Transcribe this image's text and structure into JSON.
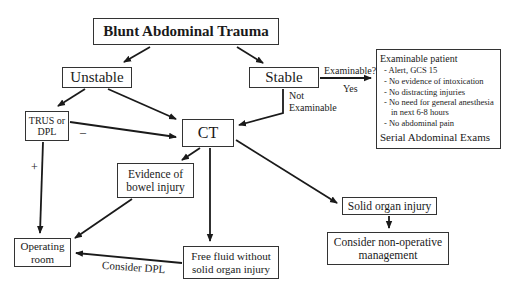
{
  "diagram": {
    "title": "Blunt Abdominal Trauma",
    "nodes": {
      "unstable": "Unstable",
      "stable": "Stable",
      "trus_line1": "TRUS or",
      "trus_line2": "DPL",
      "ct": "CT",
      "evidence_line1": "Evidence of",
      "evidence_line2": "bowel injury",
      "or_line1": "Operating",
      "or_line2": "room",
      "freefluid_line1": "Free fluid without",
      "freefluid_line2": "solid organ injury",
      "solid": "Solid organ injury",
      "nonop_line1": "Consider non-operative",
      "nonop_line2": "management"
    },
    "examinable_box": {
      "heading": "Examinable patient",
      "criteria": [
        "- Alert, GCS 15",
        "- No evidence of intoxication",
        "- No distracting injuries",
        "- No need for general anesthesia in next 6-8 hours",
        "- No abdominal pain"
      ],
      "footer": "Serial Abdominal Exams"
    },
    "edge_labels": {
      "examinable_q": "Examinable?",
      "yes": "Yes",
      "not_line1": "Not",
      "not_line2": "Examinable",
      "minus": "–",
      "plus": "+",
      "consider_dpl": "Consider DPL"
    },
    "colors": {
      "line": "#1a1a1a",
      "box_border": "#333333",
      "background": "#ffffff"
    }
  }
}
